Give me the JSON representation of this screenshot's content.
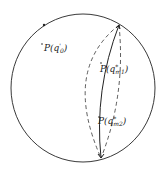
{
  "diagram": {
    "type": "sphere",
    "colors": {
      "stroke": "#222222",
      "background": "#ffffff"
    },
    "labels": {
      "point_q0": "P(q'0)",
      "point_m1": "P(q*m1)",
      "point_m2": "P(q*m2)"
    },
    "label_parts": {
      "q0": {
        "main": "P(q",
        "sub": "0",
        "sup": "'",
        "close": ")"
      },
      "m1": {
        "main": "P(q",
        "sub": "m1",
        "sup": "*",
        "close": ")"
      },
      "m2": {
        "main": "P(q",
        "sub": "m2",
        "sup": "*",
        "close": ")"
      }
    }
  }
}
